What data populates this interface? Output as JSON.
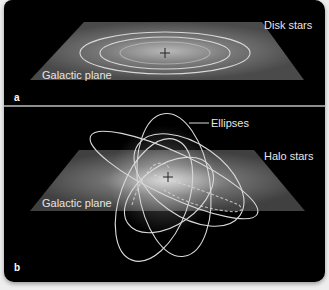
{
  "panels": [
    {
      "letter": "a",
      "labels": {
        "disk_stars": "Disk stars",
        "galactic_plane": "Galactic plane"
      }
    },
    {
      "letter": "b",
      "labels": {
        "ellipses": "Ellipses",
        "halo_stars": "Halo stars",
        "galactic_plane": "Galactic plane"
      }
    }
  ],
  "colors": {
    "background": "#000000",
    "plane": "#5a5a5a",
    "orbit": "#d8d8d8",
    "text": "#e6e6e6",
    "divider": "#bdbdbd"
  }
}
